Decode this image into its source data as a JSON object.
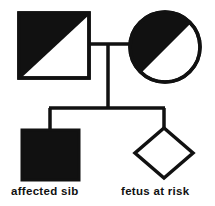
{
  "diagram": {
    "type": "pedigree-chart",
    "title": "",
    "background_color": "#ffffff",
    "line_color": "#111111",
    "fill_color": "#111111",
    "stroke_width": 3,
    "generations": [
      {
        "generation": 1,
        "members": [
          {
            "id": "father",
            "symbol": "square",
            "sex": "male",
            "fill": "half-filled-diagonal",
            "status": "carrier",
            "label": ""
          },
          {
            "id": "mother",
            "symbol": "circle",
            "sex": "female",
            "fill": "half-filled-diagonal",
            "status": "carrier",
            "label": ""
          }
        ]
      },
      {
        "generation": 2,
        "members": [
          {
            "id": "sib",
            "symbol": "square",
            "sex": "male",
            "fill": "filled",
            "status": "affected",
            "label": "affected sib"
          },
          {
            "id": "fetus",
            "symbol": "diamond",
            "sex": "unknown",
            "fill": "unfilled",
            "status": "at-risk",
            "label": "fetus at risk"
          }
        ]
      }
    ],
    "relationships": [
      {
        "type": "mating-line",
        "from": "father",
        "to": "mother"
      },
      {
        "type": "descent-line",
        "from": "mating",
        "to": "sibship"
      },
      {
        "type": "sibship-line",
        "members": [
          "sib",
          "fetus"
        ]
      }
    ]
  },
  "labels": {
    "affected_sib": "affected sib",
    "fetus_at_risk": "fetus at risk"
  }
}
